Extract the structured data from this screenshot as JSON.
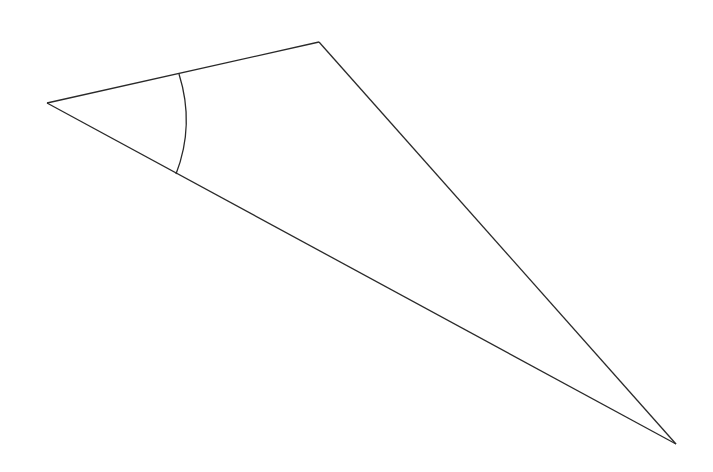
{
  "diagram": {
    "type": "triangle",
    "labels": {
      "side_top": "10",
      "angle": "35º",
      "side_right": "Y",
      "side_bottom": "40",
      "angle_bottom": "X"
    },
    "colors": {
      "stroke": "#2a2a2a",
      "text": "#333333",
      "background": "#ffffff"
    }
  }
}
